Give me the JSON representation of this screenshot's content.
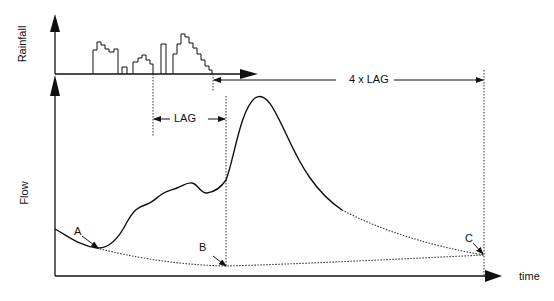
{
  "diagram": {
    "axes": {
      "rainfall_label": "Rainfall",
      "flow_label": "Flow",
      "time_label": "time"
    },
    "annotations": {
      "lag_label": "LAG",
      "four_lag_label": "4 x LAG",
      "point_a": "A",
      "point_b": "B",
      "point_c": "C"
    },
    "colors": {
      "line": "#111111",
      "dotted": "#333333",
      "background": "#ffffff"
    }
  }
}
